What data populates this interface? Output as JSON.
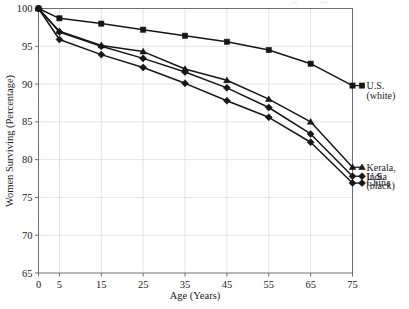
{
  "chart_data": {
    "type": "line",
    "title": "",
    "xlabel": "Age (Years)",
    "ylabel": "Women Surviving (Percentage)",
    "x": [
      0,
      5,
      15,
      25,
      35,
      45,
      55,
      65,
      75
    ],
    "xtick_labels": [
      "0",
      "5",
      "15",
      "25",
      "35",
      "45",
      "55",
      "65",
      "75"
    ],
    "ytick_labels": [
      "65",
      "70",
      "75",
      "80",
      "85",
      "90",
      "95",
      "100"
    ],
    "ylim": [
      65,
      100
    ],
    "xlim": [
      0,
      75
    ],
    "grid": true,
    "legend_position": "right-outside",
    "series": [
      {
        "name": "U.S. (white)",
        "legend_lines": [
          "U.S.",
          "(white)"
        ],
        "marker": "square",
        "values": [
          100,
          98.7,
          98.0,
          97.2,
          96.4,
          95.6,
          94.5,
          92.7,
          89.8
        ]
      },
      {
        "name": "Kerala, India",
        "legend_lines": [
          "Kerala,",
          "India"
        ],
        "marker": "triangle",
        "values": [
          100,
          97.0,
          95.1,
          94.3,
          92.0,
          90.5,
          88.0,
          85.0,
          79.0
        ]
      },
      {
        "name": "U.S. (black)",
        "legend_lines": [
          "U.S.",
          "(black)"
        ],
        "marker": "diamond",
        "values": [
          100,
          96.9,
          95.0,
          93.4,
          91.6,
          89.5,
          86.9,
          83.4,
          77.8
        ]
      },
      {
        "name": "China",
        "legend_lines": [
          "China"
        ],
        "marker": "diamond",
        "values": [
          100,
          95.9,
          93.9,
          92.2,
          90.1,
          87.8,
          85.6,
          82.3,
          76.9
        ]
      }
    ]
  }
}
